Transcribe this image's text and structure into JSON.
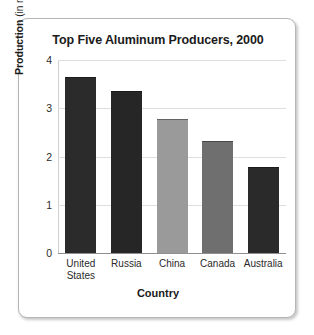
{
  "figure": {
    "border_color": "#b6b6b6",
    "background": "#ffffff"
  },
  "chart_data": {
    "type": "bar",
    "title": "Top Five Aluminum Producers, 2000",
    "xlabel": "Country",
    "ylabel_bold": "Production",
    "ylabel_rest": " (in million metric tons)",
    "ylabel_full": "Production (in million metric tons)",
    "ylim": [
      0,
      4
    ],
    "yticks": [
      0,
      1,
      2,
      3,
      4
    ],
    "ytick_labels": [
      "0",
      "1",
      "2",
      "3",
      "4"
    ],
    "grid": "horizontal",
    "legend": "none",
    "categories": [
      "United States",
      "Russia",
      "China",
      "Canada",
      "Australia"
    ],
    "category_label_lines": [
      [
        "United",
        "States"
      ],
      [
        "Russia"
      ],
      [
        "China"
      ],
      [
        "Canada"
      ],
      [
        "Australia"
      ]
    ],
    "values": [
      3.64,
      3.35,
      2.78,
      2.33,
      1.79
    ],
    "bar_colors": [
      "#2b2b2b",
      "#262626",
      "#9a9a9a",
      "#6f6f6f",
      "#2a2a2a"
    ]
  }
}
